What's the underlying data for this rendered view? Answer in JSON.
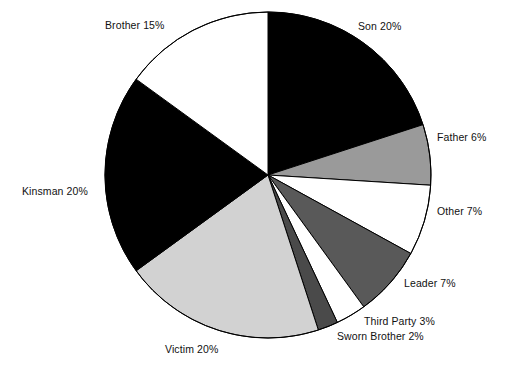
{
  "chart_data": {
    "type": "pie",
    "title": "",
    "subtitle": "",
    "xlabel": "",
    "ylabel": "",
    "legend_position": "none",
    "grid": false,
    "labels_show_percent": true,
    "start_angle_deg": 0,
    "direction": "clockwise",
    "center": {
      "x": 268,
      "y": 175
    },
    "radius": 163,
    "outline_color": "#000000",
    "background": "#ffffff",
    "categories": [
      "Son",
      "Father",
      "Other",
      "Leader",
      "Third Party",
      "Sworn Brother",
      "Victim",
      "Kinsman",
      "Brother"
    ],
    "values": [
      20,
      6,
      7,
      7,
      3,
      2,
      20,
      20,
      15
    ],
    "colors": [
      "#000000",
      "#9a9a9a",
      "#ffffff",
      "#595959",
      "#ffffff",
      "#4a4a4a",
      "#d2d2d2",
      "#000000",
      "#ffffff"
    ],
    "slices": [
      {
        "label": "Son",
        "value": 20,
        "text": "Son 20%",
        "color": "#000000"
      },
      {
        "label": "Father",
        "value": 6,
        "text": "Father 6%",
        "color": "#9a9a9a"
      },
      {
        "label": "Other",
        "value": 7,
        "text": "Other 7%",
        "color": "#ffffff"
      },
      {
        "label": "Leader",
        "value": 7,
        "text": "Leader 7%",
        "color": "#595959"
      },
      {
        "label": "Third Party",
        "value": 3,
        "text": "Third Party 3%",
        "color": "#ffffff"
      },
      {
        "label": "Sworn Brother",
        "value": 2,
        "text": "Sworn Brother 2%",
        "color": "#4a4a4a"
      },
      {
        "label": "Victim",
        "value": 20,
        "text": "Victim 20%",
        "color": "#d2d2d2"
      },
      {
        "label": "Kinsman",
        "value": 20,
        "text": "Kinsman 20%",
        "color": "#000000"
      },
      {
        "label": "Brother",
        "value": 15,
        "text": "Brother 15%",
        "color": "#ffffff"
      }
    ],
    "total": 100
  }
}
